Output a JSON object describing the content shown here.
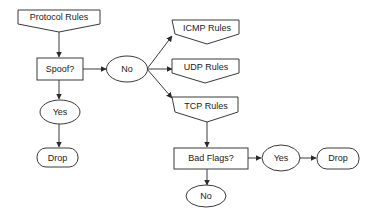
{
  "nodes": {
    "protocol_rules": {
      "label": "Protocol Rules",
      "shape": "offpage-connector"
    },
    "spoof": {
      "label": "Spoof?",
      "shape": "rectangle"
    },
    "spoof_no": {
      "label": "No",
      "shape": "ellipse"
    },
    "spoof_yes": {
      "label": "Yes",
      "shape": "ellipse"
    },
    "drop_left": {
      "label": "Drop",
      "shape": "rounded-rectangle"
    },
    "icmp_rules": {
      "label": "ICMP Rules",
      "shape": "offpage-connector"
    },
    "udp_rules": {
      "label": "UDP Rules",
      "shape": "offpage-connector"
    },
    "tcp_rules": {
      "label": "TCP Rules",
      "shape": "offpage-connector"
    },
    "bad_flags": {
      "label": "Bad Flags?",
      "shape": "rectangle"
    },
    "flags_yes": {
      "label": "Yes",
      "shape": "ellipse"
    },
    "drop_right": {
      "label": "Drop",
      "shape": "rounded-rectangle"
    },
    "flags_no": {
      "label": "No",
      "shape": "ellipse"
    }
  },
  "edges": [
    {
      "from": "Protocol Rules",
      "to": "Spoof?"
    },
    {
      "from": "Spoof?",
      "to": "No"
    },
    {
      "from": "Spoof?",
      "to": "Yes"
    },
    {
      "from": "Yes",
      "to": "Drop"
    },
    {
      "from": "No",
      "to": "ICMP Rules"
    },
    {
      "from": "No",
      "to": "UDP Rules"
    },
    {
      "from": "No",
      "to": "TCP Rules"
    },
    {
      "from": "TCP Rules",
      "to": "Bad Flags?"
    },
    {
      "from": "Bad Flags?",
      "to": "Yes"
    },
    {
      "from": "Yes",
      "to": "Drop"
    },
    {
      "from": "Bad Flags?",
      "to": "No"
    }
  ],
  "colors": {
    "stroke": "#3a3a3a",
    "fill": "#ffffff",
    "text": "#1a1a1a"
  }
}
